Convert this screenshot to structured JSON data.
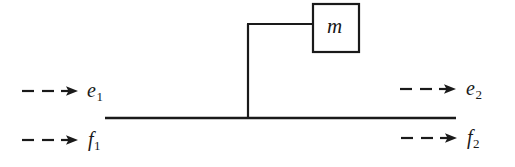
{
  "figure": {
    "kind": "mechanical-system-diagram",
    "background_color": "#ffffff",
    "stroke_color": "#1a1a1a",
    "width": 515,
    "height": 167
  },
  "mass_block": {
    "label": "m",
    "box": {
      "x": 312,
      "y": 3,
      "width": 47,
      "height": 49
    },
    "border_color": "#1a1a1a",
    "fill_color": "#ffffff"
  },
  "rod": {
    "name": "horizontal-rod",
    "x1": 105,
    "y1": 118,
    "x2": 456,
    "y2": 118,
    "stroke_width": 2.6
  },
  "post": {
    "name": "vertical-post",
    "x1": 248,
    "y1": 118,
    "x2": 248,
    "y2": 24,
    "stroke_width": 2.2
  },
  "arm": {
    "name": "horizontal-arm",
    "x1": 247,
    "y1": 24,
    "x2": 313,
    "y2": 24,
    "stroke_width": 2.2
  },
  "ports": [
    {
      "id": "e1",
      "label": "e",
      "subscript": "1",
      "side": "left",
      "quantity": "effort",
      "arrow": {
        "x1": 22,
        "y1": 91,
        "x2": 78,
        "y2": 91,
        "direction": "right",
        "style": "dashed"
      }
    },
    {
      "id": "f1",
      "label": "f",
      "subscript": "1",
      "side": "left",
      "quantity": "flow",
      "arrow": {
        "x1": 22,
        "y1": 140,
        "x2": 78,
        "y2": 140,
        "direction": "right",
        "style": "dashed"
      }
    },
    {
      "id": "e2",
      "label": "e",
      "subscript": "2",
      "side": "right",
      "quantity": "effort",
      "arrow": {
        "x1": 400,
        "y1": 89,
        "x2": 456,
        "y2": 89,
        "direction": "right",
        "style": "dashed"
      }
    },
    {
      "id": "f2",
      "label": "f",
      "subscript": "2",
      "side": "right",
      "quantity": "flow",
      "arrow": {
        "x1": 401,
        "y1": 138,
        "x2": 457,
        "y2": 138,
        "direction": "right",
        "style": "dashed"
      }
    }
  ]
}
